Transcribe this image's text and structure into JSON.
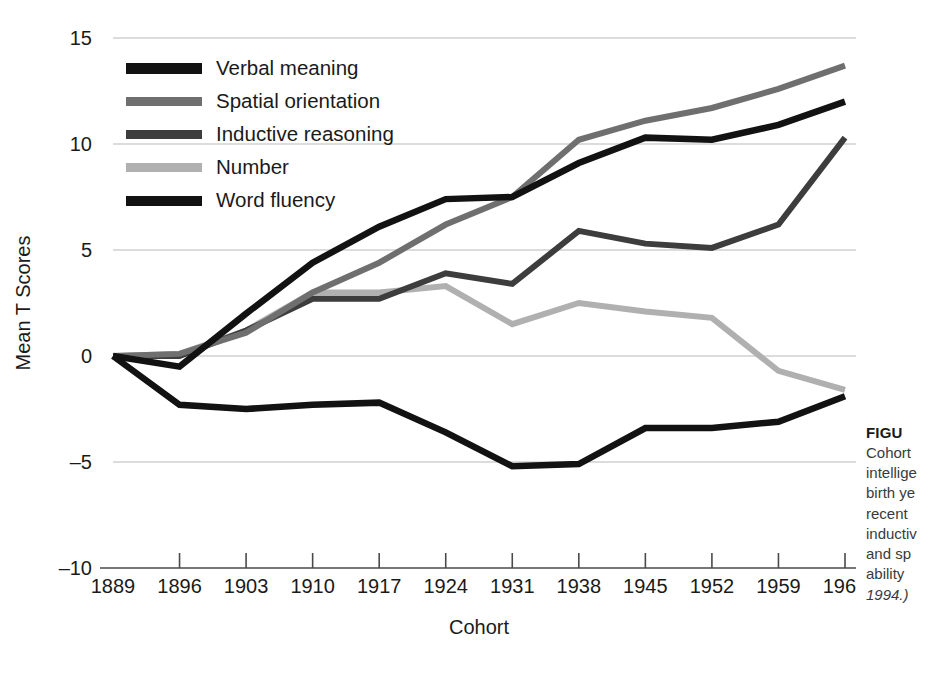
{
  "chart_data": {
    "type": "line",
    "title": "",
    "xlabel": "Cohort",
    "ylabel": "Mean T Scores",
    "categories": [
      1889,
      1896,
      1903,
      1910,
      1917,
      1924,
      1931,
      1938,
      1945,
      1952,
      1959,
      1966
    ],
    "xtick_labels": [
      "1889",
      "1896",
      "1903",
      "1910",
      "1917",
      "1924",
      "1931",
      "1938",
      "1945",
      "1952",
      "1959",
      "1966"
    ],
    "ytick_labels": [
      "15",
      "10",
      "5",
      "0",
      "–5",
      "–10"
    ],
    "yticks": [
      15,
      10,
      5,
      0,
      -5,
      -10
    ],
    "ylim": [
      -10,
      15
    ],
    "xlim": [
      1889,
      1966
    ],
    "grid": "horizontal",
    "legend_position": "upper-left-inside",
    "series": [
      {
        "name": "Verbal meaning",
        "color": "#121212",
        "width": 6.5,
        "values": [
          0.0,
          -0.5,
          2.0,
          4.4,
          6.1,
          7.4,
          7.5,
          9.1,
          10.3,
          10.2,
          10.9,
          12.0
        ]
      },
      {
        "name": "Spatial orientation",
        "color": "#6f6f6f",
        "width": 6.0,
        "values": [
          0.0,
          0.1,
          1.1,
          3.0,
          4.4,
          6.2,
          7.5,
          10.2,
          11.1,
          11.7,
          12.6,
          13.7
        ]
      },
      {
        "name": "Inductive reasoning",
        "color": "#3d3d3d",
        "width": 6.0,
        "values": [
          0.0,
          0.0,
          1.2,
          2.7,
          2.7,
          3.9,
          3.4,
          5.9,
          5.3,
          5.1,
          6.2,
          10.3
        ]
      },
      {
        "name": "Number",
        "color": "#b0b0b0",
        "width": 6.0,
        "values": [
          0.0,
          0.1,
          1.2,
          3.0,
          3.0,
          3.3,
          1.5,
          2.5,
          2.1,
          1.8,
          -0.7,
          -1.6
        ]
      },
      {
        "name": "Word fluency",
        "color": "#121212",
        "width": 6.5,
        "values": [
          0.0,
          -2.3,
          -2.5,
          -2.3,
          -2.2,
          -3.6,
          -5.2,
          -5.1,
          -3.4,
          -3.4,
          -3.1,
          -1.9
        ]
      }
    ]
  },
  "legend": {
    "items": [
      {
        "label": "Verbal meaning",
        "color": "#121212",
        "thickness": 11
      },
      {
        "label": "Spatial orientation",
        "color": "#6f6f6f",
        "thickness": 9
      },
      {
        "label": "Inductive reasoning",
        "color": "#3d3d3d",
        "thickness": 9
      },
      {
        "label": "Number",
        "color": "#b0b0b0",
        "thickness": 9
      },
      {
        "label": "Word fluency",
        "color": "#121212",
        "thickness": 10
      }
    ]
  },
  "caption": {
    "heading": "FIGU",
    "lines": [
      "Cohort",
      "intellige",
      "birth ye",
      "recent",
      "inductiv",
      "and sp",
      "ability"
    ],
    "source": "1994.)"
  }
}
